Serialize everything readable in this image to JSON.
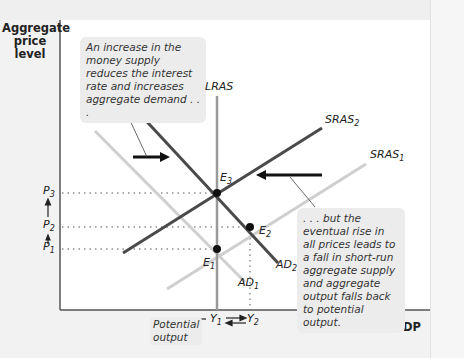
{
  "axes": {
    "y_label_lines": [
      "Aggregate",
      "price",
      "level"
    ],
    "x_label": "Real GDP"
  },
  "callouts": {
    "top_left": "An increase in the money supply reduces the interest rate and increases aggregate demand . . .",
    "bottom_right": ". . . but the eventual rise in all prices leads to a fall in short-run aggregate supply and aggregate output falls back to potential output.",
    "potential_output": "Potential output"
  },
  "curves": {
    "lras": "LRAS",
    "sras1": "SRAS",
    "sras1_sub": "1",
    "sras2": "SRAS",
    "sras2_sub": "2",
    "ad1": "AD",
    "ad1_sub": "1",
    "ad2": "AD",
    "ad2_sub": "2"
  },
  "points": {
    "e1": "E",
    "e1_sub": "1",
    "e2": "E",
    "e2_sub": "2",
    "e3": "E",
    "e3_sub": "3"
  },
  "price_levels": {
    "p1": "P",
    "p1_sub": "1",
    "p2": "P",
    "p2_sub": "2",
    "p3": "P",
    "p3_sub": "3"
  },
  "outputs": {
    "y1": "Y",
    "y1_sub": "1",
    "y2": "Y",
    "y2_sub": "2"
  },
  "colors": {
    "dark_curve": "#4a4a4a",
    "light_curve": "#cfcfcf",
    "lras": "#9a9a9a",
    "callout_bg": "#ececec"
  }
}
